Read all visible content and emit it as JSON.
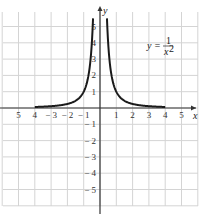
{
  "chart_data": {
    "type": "line",
    "title": "",
    "xlabel": "x",
    "ylabel": "y",
    "xlim": [
      -6,
      6
    ],
    "ylim": [
      -6,
      6
    ],
    "grid": true,
    "x_ticks": [
      -5,
      -4,
      -3,
      -2,
      -1,
      1,
      2,
      3,
      4,
      5
    ],
    "x_tick_labels": [
      "5",
      "4",
      "− 3",
      "− 2",
      "− 1",
      "1",
      "2",
      "3",
      "4",
      "5"
    ],
    "y_ticks": [
      5,
      4,
      3,
      2,
      1,
      -1,
      -2,
      -3,
      -4,
      -5
    ],
    "y_tick_labels": [
      "5",
      "4",
      "3",
      "2",
      "1",
      "− 1",
      "− 2",
      "− 3",
      "− 4",
      "− 5"
    ],
    "series": [
      {
        "name": "y = 1/x^2",
        "function": "1/x^2",
        "domain": [
          -4,
          4
        ],
        "y_clip": 5.5,
        "color": "#1a1a1a",
        "sample_points": [
          {
            "x": -4,
            "y": 0.0625
          },
          {
            "x": -3,
            "y": 0.111
          },
          {
            "x": -2,
            "y": 0.25
          },
          {
            "x": -1,
            "y": 1
          },
          {
            "x": -0.5,
            "y": 4
          },
          {
            "x": -0.43,
            "y": 5.5
          },
          {
            "x": 0.43,
            "y": 5.5
          },
          {
            "x": 0.5,
            "y": 4
          },
          {
            "x": 1,
            "y": 1
          },
          {
            "x": 2,
            "y": 0.25
          },
          {
            "x": 3,
            "y": 0.111
          },
          {
            "x": 4,
            "y": 0.0625
          }
        ]
      }
    ],
    "annotations": [
      {
        "text": "y = 1/x²",
        "position": [
          3.3,
          4
        ]
      }
    ]
  },
  "labels": {
    "x_axis": "x",
    "y_axis": "y",
    "equation_lhs": "y =",
    "equation_num": "1",
    "equation_den": "x",
    "equation_exp": "2"
  },
  "colors": {
    "grid": "#d4d4d4",
    "axis": "#333333",
    "curve": "#1a1a1a"
  }
}
